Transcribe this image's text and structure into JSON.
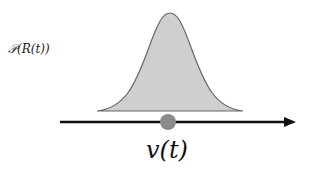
{
  "diagram": {
    "distribution_label": "𝒫(R(t))",
    "variable_label": "v(t)",
    "colors": {
      "curve_fill": "#cfcfcf",
      "curve_stroke": "#666666",
      "axis": "#111111",
      "point": "#8a8a8a"
    }
  }
}
